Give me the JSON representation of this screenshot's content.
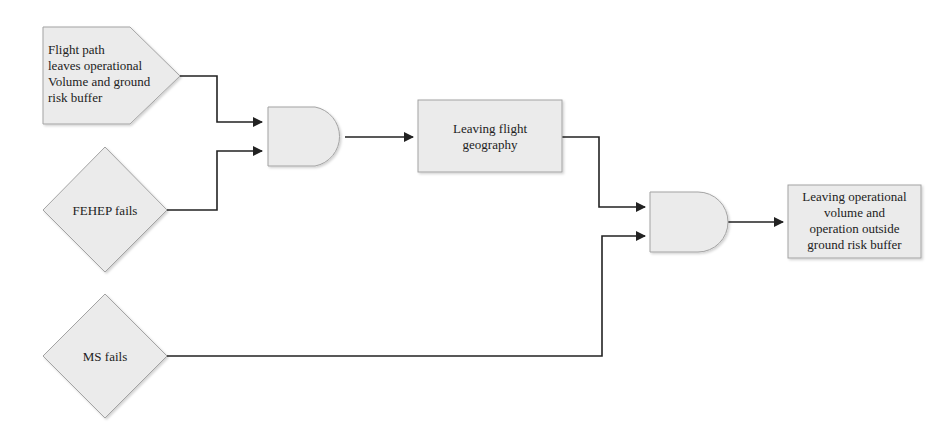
{
  "diagram": {
    "type": "fault-tree",
    "nodes": [
      {
        "id": "n1",
        "shape": "pentagon",
        "label": "Flight path leaves operational Volume and ground risk buffer",
        "lines": [
          "Flight path",
          "leaves operational",
          "Volume and ground",
          "risk buffer"
        ]
      },
      {
        "id": "n2",
        "shape": "diamond",
        "label": "FEHEP fails"
      },
      {
        "id": "n3",
        "shape": "diamond",
        "label": "MS fails"
      },
      {
        "id": "g1",
        "shape": "and-gate",
        "label": ""
      },
      {
        "id": "n4",
        "shape": "rectangle",
        "label": "Leaving flight geography",
        "lines": [
          "Leaving flight",
          "geography"
        ]
      },
      {
        "id": "g2",
        "shape": "and-gate",
        "label": ""
      },
      {
        "id": "n5",
        "shape": "rectangle",
        "label": "Leaving operational volume and operation outside ground risk buffer",
        "lines": [
          "Leaving operational",
          "volume and",
          "operation outside",
          "ground risk buffer"
        ]
      }
    ],
    "edges": [
      {
        "from": "n1",
        "to": "g1"
      },
      {
        "from": "n2",
        "to": "g1"
      },
      {
        "from": "g1",
        "to": "n4"
      },
      {
        "from": "n4",
        "to": "g2"
      },
      {
        "from": "n3",
        "to": "g2"
      },
      {
        "from": "g2",
        "to": "n5"
      }
    ],
    "colors": {
      "fill": "#ebebeb",
      "stroke": "#a0a0a0",
      "line": "#222222"
    }
  }
}
